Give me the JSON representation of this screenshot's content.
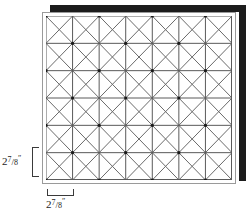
{
  "figure": {
    "type": "quilt-block-layout",
    "panel": {
      "name": "quilt-panel",
      "background_color": "#ffffff",
      "frame_color": "#9a9a9a",
      "shadow_color": "#1c1c1c"
    },
    "grid": {
      "columns": 7,
      "rows": 6,
      "cell_width_px": 26.6,
      "cell_height_px": 27.3,
      "line_color": "#5a5a5a",
      "diagonal_color": "#6a6a6a",
      "line_width": 1,
      "diagonals": "both",
      "node_color": "#1a1a1a"
    },
    "dimensions": {
      "vertical": {
        "label_whole": "2",
        "label_numerator": "7",
        "label_denominator": "8",
        "label_unit": "″",
        "label_full": "2 7/8″",
        "spans": "one cell height"
      },
      "horizontal": {
        "label_whole": "2",
        "label_numerator": "7",
        "label_denominator": "8",
        "label_unit": "″",
        "label_full": "2 7/8″",
        "spans": "one cell width"
      }
    }
  }
}
